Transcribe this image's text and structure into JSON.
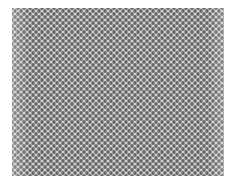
{
  "image": {
    "subject": "diamond mesh fabric texture",
    "colors": {
      "background": "#ffffff",
      "mesh_light": "#d4d4d4",
      "mesh_dark": "#5a5a5a"
    }
  }
}
